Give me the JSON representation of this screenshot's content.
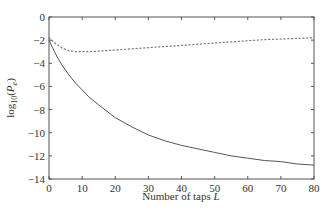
{
  "chart_data": {
    "type": "line",
    "title": "",
    "xlabel": "Number of taps L",
    "xlabel_main": "Number of  taps ",
    "xlabel_var": "L",
    "ylabel": "log10(Pe)",
    "ylabel_prefix": "log",
    "ylabel_sub": "10",
    "ylabel_paren_open": "(",
    "ylabel_var": "P",
    "ylabel_var_sub": "e",
    "ylabel_paren_close": ")",
    "xlim": [
      0,
      80
    ],
    "ylim": [
      -14,
      0
    ],
    "xticks": [
      0,
      10,
      20,
      30,
      40,
      50,
      60,
      70,
      80
    ],
    "yticks": [
      0,
      -2,
      -4,
      -6,
      -8,
      -10,
      -12,
      -14
    ],
    "ytick_labels": [
      "0",
      "−2",
      "−4",
      "−6",
      "−8",
      "−10",
      "−12",
      "−14"
    ],
    "grid": false,
    "legend": null,
    "series": [
      {
        "name": "solid",
        "style": "solid",
        "x": [
          0,
          1,
          2,
          3,
          4,
          5,
          6,
          8,
          10,
          12,
          15,
          20,
          25,
          30,
          35,
          40,
          45,
          50,
          55,
          60,
          65,
          70,
          75,
          80
        ],
        "values": [
          -2.0,
          -2.6,
          -3.2,
          -3.7,
          -4.2,
          -4.6,
          -5.0,
          -5.7,
          -6.3,
          -6.9,
          -7.6,
          -8.7,
          -9.5,
          -10.2,
          -10.7,
          -11.1,
          -11.4,
          -11.7,
          -12.0,
          -12.2,
          -12.4,
          -12.5,
          -12.7,
          -12.8
        ]
      },
      {
        "name": "dotted",
        "style": "dotted",
        "x": [
          0,
          2,
          4,
          6,
          8,
          10,
          12,
          15,
          20,
          25,
          30,
          35,
          40,
          45,
          50,
          55,
          60,
          65,
          70,
          75,
          80
        ],
        "values": [
          -1.8,
          -2.3,
          -2.7,
          -2.9,
          -3.0,
          -3.0,
          -3.0,
          -2.95,
          -2.85,
          -2.75,
          -2.65,
          -2.55,
          -2.45,
          -2.35,
          -2.25,
          -2.15,
          -2.05,
          -1.95,
          -1.9,
          -1.85,
          -1.8
        ]
      }
    ]
  },
  "colors": {
    "axis": "#555555",
    "solid_line": "#555555",
    "dotted_line": "#777777"
  }
}
